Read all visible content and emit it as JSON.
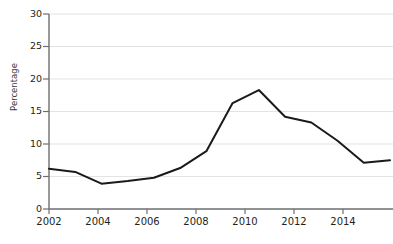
{
  "chart_data": {
    "type": "line",
    "title": "",
    "xlabel": "",
    "ylabel": "Percentage",
    "x": [
      2002,
      2003,
      2004,
      2005,
      2006,
      2007,
      2008,
      2009,
      2010,
      2011,
      2012,
      2013,
      2014,
      2015
    ],
    "values": [
      6.2,
      5.7,
      3.9,
      4.3,
      4.8,
      6.3,
      8.9,
      16.3,
      18.3,
      14.2,
      13.3,
      10.5,
      7.1,
      7.5
    ],
    "series": [
      {
        "name": "Percentage",
        "color": "#1a1a1a",
        "values": [
          6.2,
          5.7,
          3.9,
          4.3,
          4.8,
          6.3,
          8.9,
          16.3,
          18.3,
          14.2,
          13.3,
          10.5,
          7.1,
          7.5
        ]
      }
    ],
    "xlim": [
      2002,
      2015
    ],
    "ylim": [
      0,
      30
    ],
    "yticks": [
      0,
      5,
      10,
      15,
      20,
      25,
      30
    ],
    "ytick_labels": [
      "0",
      "5",
      "10",
      "15",
      "20",
      "25",
      "30"
    ],
    "xticks": [
      2002,
      2004,
      2006,
      2008,
      2010,
      2012,
      2014
    ],
    "xtick_labels": [
      "2002",
      "2004",
      "2006",
      "2008",
      "2010",
      "2012",
      "2014"
    ],
    "minor_xticks": [
      2003,
      2005,
      2007,
      2009,
      2011,
      2013,
      2015
    ],
    "grid": true,
    "grid_axis": "y",
    "grid_color": "#e3e3e5",
    "axis_color": "#6d6e71",
    "legend": false,
    "legend_position": "none",
    "annotations": []
  },
  "style": {
    "background": "#ffffff",
    "line_color": "#1a1a1a",
    "line_width": 2,
    "tick_text_color": "#231f20"
  }
}
